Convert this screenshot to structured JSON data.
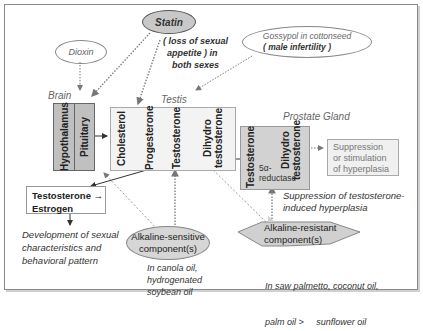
{
  "sources": {
    "dioxin": "Dioxin",
    "statin": "Statin",
    "statin_effect": [
      "( loss of sexual",
      "appetite )  in",
      "both sexes"
    ],
    "gossypol": "Gossypol in cottonseed",
    "gossypol_effect": "( male infertility )"
  },
  "brain": {
    "label": "Brain",
    "hypothalamus": "Hypothalamus",
    "pituitary": "Pituitary"
  },
  "testis": {
    "label": "Testis",
    "steps": [
      "Cholesterol",
      "Progesterone",
      "Testosterone",
      "Dihydro testosterone"
    ]
  },
  "prostate": {
    "label": "Prostate Gland",
    "testosterone": "Testosterone",
    "enzyme": [
      "5α-",
      "reductase"
    ],
    "dht": "Dihydro testosterone"
  },
  "outcome": [
    "Suppression",
    "or stimulation",
    "of hyperplasia"
  ],
  "estrogen_box": [
    "Testosterone →",
    "Estrogen"
  ],
  "development_text": [
    "Development of sexual",
    "characteristics and",
    "behavioral pattern"
  ],
  "suppression_text": [
    "Suppression of testosterone-",
    "induced hyperplasia"
  ],
  "alkaline_sensitive": {
    "label": [
      "Alkaline-sensitive",
      "component(s)"
    ],
    "sources": [
      "In canola oil,",
      "hydrogenated",
      "soybean oil"
    ]
  },
  "alkaline_resistant": {
    "label": [
      "Alkaline-resistant",
      "component(s)"
    ],
    "sources": [
      "In saw palmetto, coconut oil,",
      "palm oil >     sunflower oil"
    ]
  },
  "colors": {
    "gray_fill": "#c8c8c8",
    "light_fill": "#f2f2f2",
    "border": "#8a8a8a"
  }
}
